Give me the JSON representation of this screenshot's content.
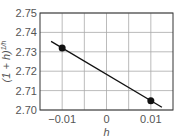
{
  "chart_data": {
    "type": "line",
    "title": "",
    "xlabel": "h",
    "ylabel": "(1 + h)^{1/h}",
    "xlim": [
      -0.015,
      0.015
    ],
    "ylim": [
      2.7,
      2.75
    ],
    "grid": true,
    "x_ticks": [
      -0.01,
      0,
      0.01
    ],
    "x_tick_labels": [
      "−0.01",
      "0",
      "0.01"
    ],
    "y_ticks": [
      2.7,
      2.71,
      2.72,
      2.73,
      2.74,
      2.75
    ],
    "y_tick_labels": [
      "2.70",
      "2.71",
      "2.72",
      "2.73",
      "2.74",
      "2.75"
    ],
    "series": [
      {
        "name": "line",
        "x": [
          -0.0125,
          0.0125
        ],
        "y": [
          2.7354,
          2.7014
        ]
      },
      {
        "name": "points",
        "x": [
          -0.01,
          0.01
        ],
        "y": [
          2.732,
          2.7048
        ]
      }
    ]
  },
  "labels": {
    "xlabel": "h",
    "ylabel": "(1 + h)",
    "ylabel_exp": "1/h"
  }
}
